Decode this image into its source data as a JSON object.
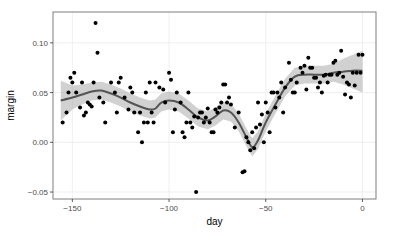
{
  "chart_data": {
    "type": "scatter",
    "title": "",
    "xlabel": "day",
    "ylabel": "margin",
    "xlim": [
      -160,
      7
    ],
    "ylim": [
      -0.057,
      0.131
    ],
    "grid": true,
    "legend": null,
    "x_ticks": [
      -150,
      -100,
      -50,
      0
    ],
    "x_tick_labels": [
      "-150",
      "-100",
      "-50",
      "0"
    ],
    "y_ticks": [
      -0.05,
      0.0,
      0.05,
      0.1
    ],
    "y_tick_labels": [
      "-0.05",
      "0.00",
      "0.05",
      "0.10"
    ],
    "series": [
      {
        "name": "observations",
        "kind": "points",
        "color": "#000000",
        "points": [
          [
            -155,
            0.02
          ],
          [
            -153,
            0.03
          ],
          [
            -152,
            0.05
          ],
          [
            -151,
            0.065
          ],
          [
            -150,
            0.06
          ],
          [
            -149,
            0.07
          ],
          [
            -148,
            0.05
          ],
          [
            -146,
            0.035
          ],
          [
            -145,
            0.06
          ],
          [
            -144,
            0.027
          ],
          [
            -143,
            0.03
          ],
          [
            -142,
            0.04
          ],
          [
            -141,
            0.038
          ],
          [
            -140,
            0.036
          ],
          [
            -139,
            0.06
          ],
          [
            -138,
            0.12
          ],
          [
            -137,
            0.09
          ],
          [
            -136,
            0.045
          ],
          [
            -134,
            0.04
          ],
          [
            -133,
            0.02
          ],
          [
            -130,
            0.06
          ],
          [
            -128,
            0.05
          ],
          [
            -127,
            0.03
          ],
          [
            -126,
            0.06
          ],
          [
            -125,
            0.065
          ],
          [
            -123,
            0.045
          ],
          [
            -121,
            0.033
          ],
          [
            -120,
            0.055
          ],
          [
            -119,
            0.05
          ],
          [
            -118,
            0.03
          ],
          [
            -116,
            0.01
          ],
          [
            -115,
            0.03
          ],
          [
            -114,
            0.0
          ],
          [
            -113,
            0.02
          ],
          [
            -112,
            0.05
          ],
          [
            -111,
            0.02
          ],
          [
            -110,
            0.06
          ],
          [
            -109,
            0.03
          ],
          [
            -108,
            0.02
          ],
          [
            -107,
            0.06
          ],
          [
            -105,
            0.055
          ],
          [
            -103,
            0.053
          ],
          [
            -102,
            0.04
          ],
          [
            -100,
            0.07
          ],
          [
            -99,
            0.063
          ],
          [
            -98,
            0.01
          ],
          [
            -97,
            0.033
          ],
          [
            -96,
            0.05
          ],
          [
            -94,
            0.04
          ],
          [
            -93,
            0.01
          ],
          [
            -92,
            0.005
          ],
          [
            -91,
            0.02
          ],
          [
            -90,
            0.05
          ],
          [
            -89,
            0.02
          ],
          [
            -88,
            0.015
          ],
          [
            -87,
            0.026
          ],
          [
            -86,
            -0.05
          ],
          [
            -85,
            0.025
          ],
          [
            -84,
            0.03
          ],
          [
            -83,
            0.03
          ],
          [
            -82,
            0.02
          ],
          [
            -81,
            0.025
          ],
          [
            -80,
            0.034
          ],
          [
            -79,
            0.02
          ],
          [
            -78,
            0.01
          ],
          [
            -77,
            0.01
          ],
          [
            -76,
            0.033
          ],
          [
            -75,
            0.03
          ],
          [
            -74,
            0.035
          ],
          [
            -73,
            0.04
          ],
          [
            -72,
            0.058
          ],
          [
            -71,
            0.058
          ],
          [
            -70,
            0.04
          ],
          [
            -69,
            0.045
          ],
          [
            -68,
            0.038
          ],
          [
            -66,
            0.015
          ],
          [
            -64,
            0.03
          ],
          [
            -62,
            -0.03
          ],
          [
            -61,
            -0.029
          ],
          [
            -60,
            0.005
          ],
          [
            -59,
            0.0
          ],
          [
            -58,
            -0.008
          ],
          [
            -57,
            0.01
          ],
          [
            -56,
            -0.006
          ],
          [
            -55,
            0.015
          ],
          [
            -54,
            0.04
          ],
          [
            -53,
            0.018
          ],
          [
            -52,
            0.028
          ],
          [
            -51,
            0.0
          ],
          [
            -50,
            0.04
          ],
          [
            -49,
            0.03
          ],
          [
            -48,
            0.01
          ],
          [
            -47,
            0.05
          ],
          [
            -46,
            0.05
          ],
          [
            -45,
            0.035
          ],
          [
            -44,
            0.05
          ],
          [
            -43,
            0.045
          ],
          [
            -42,
            0.06
          ],
          [
            -41,
            0.03
          ],
          [
            -40,
            0.055
          ],
          [
            -38,
            0.08
          ],
          [
            -37,
            0.063
          ],
          [
            -36,
            0.05
          ],
          [
            -35,
            0.05
          ],
          [
            -34,
            0.06
          ],
          [
            -32,
            0.075
          ],
          [
            -31,
            0.07
          ],
          [
            -30,
            0.077
          ],
          [
            -29,
            0.053
          ],
          [
            -28,
            0.085
          ],
          [
            -27,
            0.075
          ],
          [
            -26,
            0.075
          ],
          [
            -25,
            0.065
          ],
          [
            -24,
            0.065
          ],
          [
            -23,
            0.055
          ],
          [
            -22,
            0.06
          ],
          [
            -21,
            0.05
          ],
          [
            -20,
            0.067
          ],
          [
            -19,
            0.068
          ],
          [
            -18,
            0.06
          ],
          [
            -17,
            0.068
          ],
          [
            -16,
            0.068
          ],
          [
            -15,
            0.08
          ],
          [
            -14,
            0.082
          ],
          [
            -13,
            0.068
          ],
          [
            -12,
            0.07
          ],
          [
            -11,
            0.092
          ],
          [
            -10,
            0.066
          ],
          [
            -9,
            0.048
          ],
          [
            -8,
            0.06
          ],
          [
            -7,
            0.058
          ],
          [
            -6,
            0.045
          ],
          [
            -5,
            0.07
          ],
          [
            -4,
            0.057
          ],
          [
            -3,
            0.07
          ],
          [
            -2,
            0.088
          ],
          [
            -1,
            0.07
          ],
          [
            0,
            0.088
          ]
        ]
      },
      {
        "name": "loess smooth",
        "kind": "line",
        "color": "#545454",
        "x": [
          -156,
          -150,
          -145,
          -140,
          -135,
          -130,
          -125,
          -120,
          -115,
          -110,
          -107,
          -104,
          -100,
          -95,
          -90,
          -85,
          -80,
          -76,
          -72,
          -68,
          -64,
          -60,
          -57,
          -54,
          -50,
          -45,
          -40,
          -35,
          -30,
          -25,
          -20,
          -15,
          -10,
          -5,
          0
        ],
        "y": [
          0.042,
          0.045,
          0.048,
          0.051,
          0.052,
          0.049,
          0.045,
          0.04,
          0.036,
          0.033,
          0.034,
          0.04,
          0.042,
          0.04,
          0.033,
          0.025,
          0.022,
          0.026,
          0.032,
          0.03,
          0.02,
          0.005,
          -0.005,
          0.002,
          0.02,
          0.038,
          0.055,
          0.066,
          0.068,
          0.068,
          0.068,
          0.07,
          0.071,
          0.072,
          0.072
        ]
      },
      {
        "name": "confidence band",
        "kind": "ribbon",
        "color": "#999999",
        "x": [
          -156,
          -150,
          -145,
          -140,
          -135,
          -130,
          -125,
          -120,
          -115,
          -110,
          -107,
          -104,
          -100,
          -95,
          -90,
          -85,
          -80,
          -76,
          -72,
          -68,
          -64,
          -60,
          -57,
          -54,
          -50,
          -45,
          -40,
          -35,
          -30,
          -25,
          -20,
          -15,
          -10,
          -5,
          0
        ],
        "lower": [
          0.022,
          0.033,
          0.038,
          0.042,
          0.043,
          0.04,
          0.036,
          0.031,
          0.027,
          0.024,
          0.025,
          0.031,
          0.033,
          0.031,
          0.024,
          0.016,
          0.013,
          0.017,
          0.023,
          0.021,
          0.011,
          -0.004,
          -0.014,
          -0.007,
          0.011,
          0.029,
          0.046,
          0.057,
          0.059,
          0.059,
          0.059,
          0.061,
          0.058,
          0.054,
          0.05
        ],
        "upper": [
          0.062,
          0.057,
          0.058,
          0.06,
          0.061,
          0.058,
          0.054,
          0.049,
          0.045,
          0.042,
          0.043,
          0.049,
          0.051,
          0.049,
          0.042,
          0.034,
          0.031,
          0.035,
          0.041,
          0.039,
          0.029,
          0.014,
          0.004,
          0.011,
          0.029,
          0.047,
          0.064,
          0.075,
          0.077,
          0.077,
          0.077,
          0.079,
          0.084,
          0.088,
          0.092
        ]
      }
    ]
  },
  "layout": {
    "panel": {
      "left": 53,
      "top": 12,
      "right": 376,
      "bottom": 199
    },
    "colors": {
      "panel_border": "#7f7f7f",
      "grid": "#ebebeb",
      "point": "#000000",
      "line": "#545454",
      "band": "#999999",
      "band_opacity": 0.45
    }
  }
}
